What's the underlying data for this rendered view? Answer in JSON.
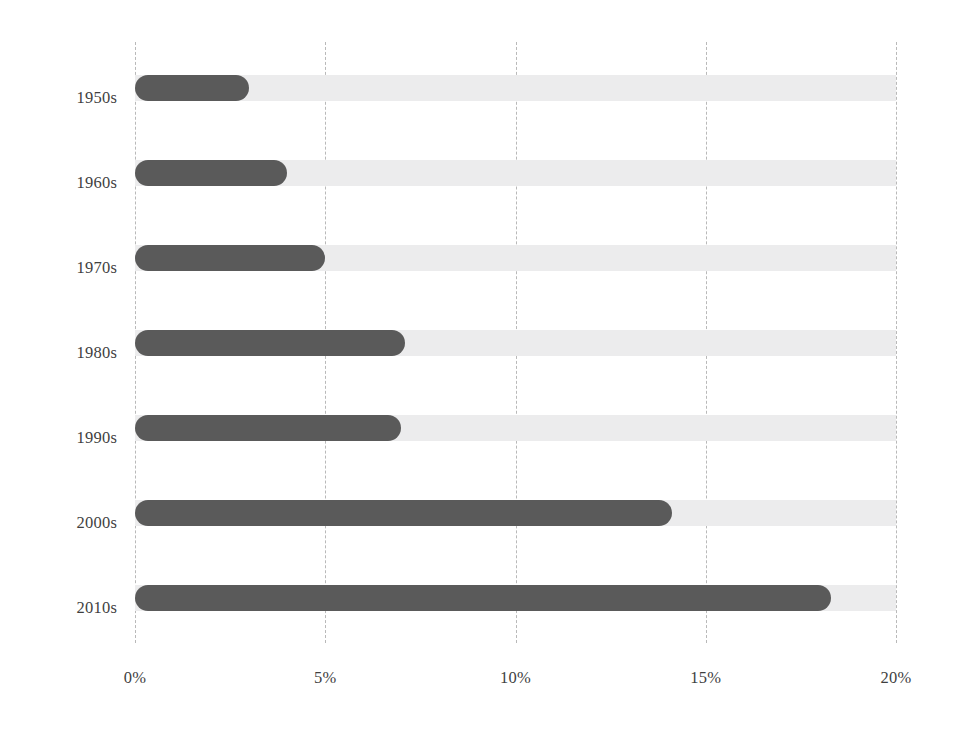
{
  "chart_data": {
    "type": "bar",
    "orientation": "horizontal",
    "title": "",
    "subtitle": "",
    "xlabel": "",
    "ylabel": "",
    "categories": [
      "1950s",
      "1960s",
      "1970s",
      "1980s",
      "1990s",
      "2000s",
      "2010s"
    ],
    "values": [
      3.0,
      4.0,
      5.0,
      7.1,
      7.0,
      14.1,
      18.3
    ],
    "value_unit": "%",
    "xlim": [
      0,
      20
    ],
    "ylim": null,
    "x_ticks": [
      0,
      5,
      10,
      15,
      20
    ],
    "x_tick_labels": [
      "0%",
      "5%",
      "10%",
      "15%",
      "20%"
    ],
    "grid": {
      "vertical": true,
      "horizontal": false,
      "style": "dashed",
      "color": "#b9b9b9"
    },
    "legend": {
      "visible": false,
      "position": "none",
      "entries": []
    },
    "annotations": [],
    "style": {
      "bar_color": "#5a5a5a",
      "track_color": "#ececed",
      "track_max": 20,
      "bar_shape": "rounded-cap",
      "background": "#ffffff",
      "text_color": "#3f3f3f"
    }
  }
}
